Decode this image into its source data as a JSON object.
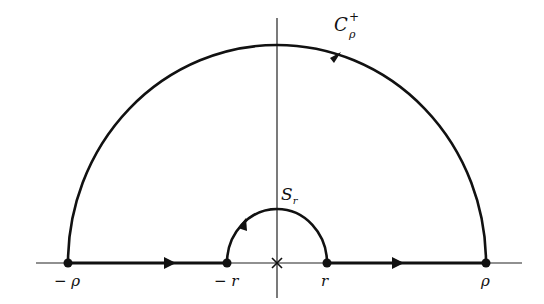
{
  "diagram": {
    "labels": {
      "big_arc_name": "C",
      "big_arc_sup": "+",
      "big_arc_sub": "ρ",
      "small_arc_name": "S",
      "small_arc_sub": "r",
      "neg_rho": "− ρ",
      "neg_r": "− r",
      "r": "r",
      "rho": "ρ"
    },
    "colors": {
      "stroke": "#111111",
      "background": "#ffffff"
    }
  }
}
